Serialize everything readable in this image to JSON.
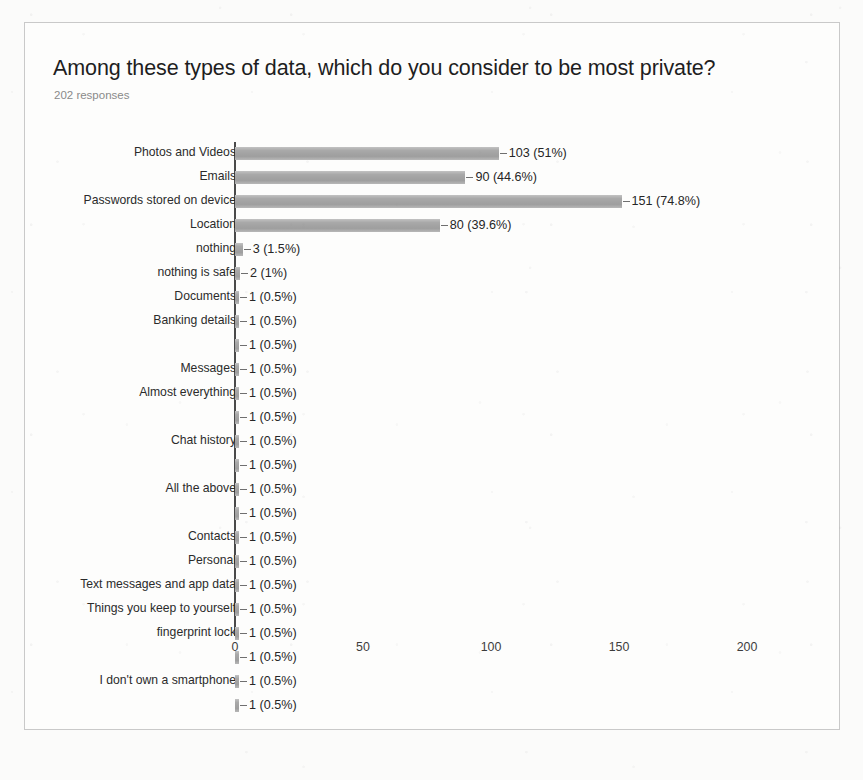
{
  "chart_data": {
    "type": "bar",
    "orientation": "horizontal",
    "title": "Among these types of data, which do you consider to be most private?",
    "subtitle": "202 responses",
    "total_responses": 202,
    "xlabel": "",
    "ylabel": "",
    "xlim": [
      0,
      200
    ],
    "xticks": [
      "0",
      "50",
      "100",
      "150",
      "200"
    ],
    "xtick_values": [
      0,
      50,
      100,
      150,
      200
    ],
    "grid": false,
    "legend": false,
    "bar_color": "#a8a8a8",
    "categories": [
      "Photos and Videos",
      "Emails",
      "Passwords stored on device",
      "Location",
      "nothing",
      "nothing is safe",
      "Documents",
      "Banking details",
      "",
      "Messages",
      "Almost everything",
      "",
      "Chat history",
      "",
      "All the above",
      "",
      "Contacts",
      "Personal",
      "Text messages and app data",
      "Things you keep to yourself",
      "fingerprint lock",
      "",
      "I don't own a smartphone",
      ""
    ],
    "values": [
      103,
      90,
      151,
      80,
      3,
      2,
      1,
      1,
      1,
      1,
      1,
      1,
      1,
      1,
      1,
      1,
      1,
      1,
      1,
      1,
      1,
      1,
      1,
      1
    ],
    "percents": [
      "51%",
      "44.6%",
      "74.8%",
      "39.6%",
      "1.5%",
      "1%",
      "0.5%",
      "0.5%",
      "0.5%",
      "0.5%",
      "0.5%",
      "0.5%",
      "0.5%",
      "0.5%",
      "0.5%",
      "0.5%",
      "0.5%",
      "0.5%",
      "0.5%",
      "0.5%",
      "0.5%",
      "0.5%",
      "0.5%",
      "0.5%"
    ],
    "data_labels": [
      "103 (51%)",
      "90 (44.6%)",
      "151 (74.8%)",
      "80 (39.6%)",
      "3 (1.5%)",
      "2 (1%)",
      "1 (0.5%)",
      "1 (0.5%)",
      "1 (0.5%)",
      "1 (0.5%)",
      "1 (0.5%)",
      "1 (0.5%)",
      "1 (0.5%)",
      "1 (0.5%)",
      "1 (0.5%)",
      "1 (0.5%)",
      "1 (0.5%)",
      "1 (0.5%)",
      "1 (0.5%)",
      "1 (0.5%)",
      "1 (0.5%)",
      "1 (0.5%)",
      "1 (0.5%)",
      "1 (0.5%)"
    ]
  }
}
